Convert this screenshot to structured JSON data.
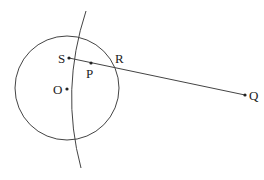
{
  "diagram": {
    "points": {
      "S": {
        "label": "S",
        "x": 69,
        "y": 58
      },
      "P": {
        "label": "P",
        "x": 91,
        "y": 63
      },
      "R": {
        "label": "R",
        "x": 114,
        "y": 67
      },
      "O": {
        "label": "O",
        "x": 67,
        "y": 89
      },
      "Q": {
        "label": "Q",
        "x": 245,
        "y": 95
      }
    },
    "circle": {
      "cx": 67,
      "cy": 88,
      "r": 52
    },
    "stroke_color": "#444444"
  }
}
